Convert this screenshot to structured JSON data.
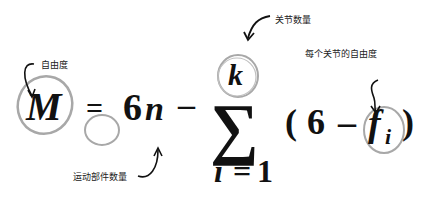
{
  "formula": {
    "lhs": "M",
    "equals": "=",
    "coef": "6",
    "n": "n",
    "minus1": "–",
    "sum": "∑",
    "upper": "k",
    "lower_var": "i",
    "lower_eq": "=",
    "lower_val": "1",
    "lparen": "(",
    "six": "6",
    "minus2": "–",
    "f": "f",
    "sub_i": "i",
    "rparen": ")"
  },
  "annotations": {
    "dof": "自由度",
    "joint_count": "关节数量",
    "per_joint_dof": "每个关节的自由度",
    "moving_parts": "运动部件数量"
  },
  "colors": {
    "circle": "#a8a8a8",
    "text": "#111111",
    "arrow": "#111111"
  }
}
